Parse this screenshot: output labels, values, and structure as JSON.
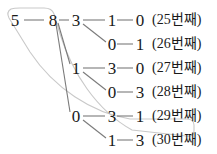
{
  "diagram": {
    "type": "tree-enumeration",
    "title": "",
    "root": {
      "value": "5",
      "x": 14,
      "y": 20
    },
    "level1": {
      "value": "8",
      "x": 52,
      "y": 20
    },
    "level2": [
      {
        "value": "3",
        "x": 75,
        "y": 20
      },
      {
        "value": "1",
        "x": 75,
        "y": 68
      },
      {
        "value": "0",
        "x": 75,
        "y": 116
      }
    ],
    "rows": [
      {
        "d3": "1",
        "d4": "0",
        "label": "(25번째)"
      },
      {
        "d3": "0",
        "d4": "1",
        "label": "(26번째)"
      },
      {
        "d3": "3",
        "d4": "0",
        "label": "(27번째)"
      },
      {
        "d3": "0",
        "d4": "3",
        "label": "(28번째)"
      },
      {
        "d3": "3",
        "d4": "1",
        "label": "(29번째)"
      },
      {
        "d3": "1",
        "d4": "3",
        "label": "(30번째)"
      }
    ],
    "colors": {
      "text": "#1a1a1a",
      "connector": "#7a7a7a",
      "highlight_outline": "#c9c9c9",
      "background": "#ffffff"
    }
  }
}
